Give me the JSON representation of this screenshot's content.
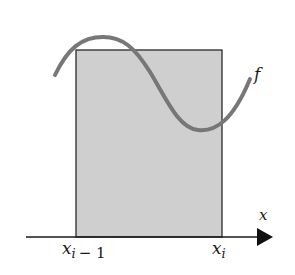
{
  "diagram": {
    "type": "riemann-rectangle",
    "function_label": "f",
    "axis_label": "x",
    "left_endpoint": {
      "base": "x",
      "sub": "i",
      "suffix": "− 1"
    },
    "right_endpoint": {
      "base": "x",
      "sub": "i"
    },
    "colors": {
      "rect_fill": "#cfcfcf",
      "rect_stroke": "#2a2a2a",
      "curve": "#777777",
      "axis": "#1a1a1a"
    }
  }
}
